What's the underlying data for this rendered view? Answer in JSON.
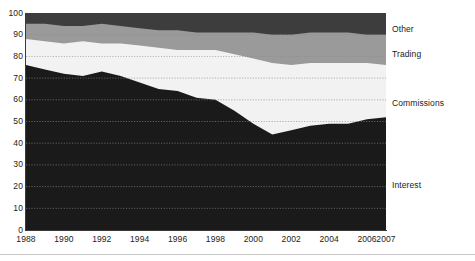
{
  "chart_data": {
    "type": "area",
    "stacked": true,
    "normalized": true,
    "title": "",
    "subtitle": "",
    "xlabel": "",
    "ylabel": "",
    "ylim": [
      0,
      100
    ],
    "xlim": [
      1988,
      2007
    ],
    "grid": true,
    "grid_style": "dotted-horizontal",
    "legend_position": "right-inline",
    "x": [
      1988,
      1989,
      1990,
      1991,
      1992,
      1993,
      1994,
      1995,
      1996,
      1997,
      1998,
      1999,
      2000,
      2001,
      2002,
      2003,
      2004,
      2005,
      2006,
      2007
    ],
    "categories": [
      "1988",
      "1989",
      "1990",
      "1991",
      "1992",
      "1993",
      "1994",
      "1995",
      "1996",
      "1997",
      "1998",
      "1999",
      "2000",
      "2001",
      "2002",
      "2003",
      "2004",
      "2005",
      "2006",
      "2007"
    ],
    "series": [
      {
        "name": "Interest",
        "color": "#1a1a1a",
        "values": [
          76,
          74,
          72,
          71,
          73,
          71,
          68,
          65,
          64,
          61,
          60,
          55,
          49,
          44,
          46,
          48,
          49,
          49,
          51,
          52
        ]
      },
      {
        "name": "Commissions",
        "color": "#f2f2f2",
        "values": [
          12,
          13,
          14,
          16,
          13,
          15,
          17,
          19,
          19,
          22,
          23,
          26,
          30,
          33,
          30,
          29,
          28,
          28,
          26,
          24
        ]
      },
      {
        "name": "Trading",
        "color": "#9a9a9a",
        "values": [
          7,
          8,
          8,
          7,
          9,
          8,
          8,
          8,
          9,
          8,
          8,
          10,
          12,
          13,
          14,
          14,
          14,
          14,
          13,
          14
        ]
      },
      {
        "name": "Other",
        "color": "#3d3d3d",
        "values": [
          5,
          5,
          6,
          6,
          5,
          6,
          7,
          8,
          8,
          9,
          9,
          9,
          9,
          10,
          10,
          9,
          9,
          9,
          10,
          10
        ]
      }
    ],
    "cumulative_boundaries": {
      "interest_top": [
        76,
        74,
        72,
        71,
        73,
        71,
        68,
        65,
        64,
        61,
        60,
        55,
        49,
        44,
        46,
        48,
        49,
        49,
        51,
        52
      ],
      "commissions_top": [
        88,
        87,
        86,
        87,
        86,
        86,
        85,
        84,
        83,
        83,
        83,
        81,
        79,
        77,
        76,
        77,
        77,
        77,
        77,
        76
      ],
      "trading_top": [
        95,
        95,
        94,
        94,
        95,
        94,
        93,
        92,
        92,
        91,
        91,
        91,
        91,
        90,
        90,
        91,
        91,
        91,
        90,
        90
      ],
      "other_top": [
        100,
        100,
        100,
        100,
        100,
        100,
        100,
        100,
        100,
        100,
        100,
        100,
        100,
        100,
        100,
        100,
        100,
        100,
        100,
        100
      ]
    },
    "y_ticks": [
      {
        "value": 100,
        "label": "100"
      },
      {
        "value": 90,
        "label": "90"
      },
      {
        "value": 80,
        "label": "80"
      },
      {
        "value": 70,
        "label": "70"
      },
      {
        "value": 60,
        "label": "60"
      },
      {
        "value": 50,
        "label": "50"
      },
      {
        "value": 40,
        "label": "40"
      },
      {
        "value": 30,
        "label": "30"
      },
      {
        "value": 20,
        "label": "20"
      },
      {
        "value": 10,
        "label": "10"
      },
      {
        "value": 0,
        "label": "0"
      }
    ],
    "x_ticks": [
      {
        "value": 1988,
        "label": "1988"
      },
      {
        "value": 1990,
        "label": "1990"
      },
      {
        "value": 1992,
        "label": "1992"
      },
      {
        "value": 1994,
        "label": "1994"
      },
      {
        "value": 1996,
        "label": "1996"
      },
      {
        "value": 1998,
        "label": "1998"
      },
      {
        "value": 2000,
        "label": "2000"
      },
      {
        "value": 2002,
        "label": "2002"
      },
      {
        "value": 2004,
        "label": "2004"
      },
      {
        "value": 2006,
        "label": "2006"
      },
      {
        "value": 2007,
        "label": "2007"
      }
    ],
    "annotations": [
      {
        "name": "Other",
        "label": "Other",
        "y_position": 24
      },
      {
        "name": "Trading",
        "label": "Trading",
        "y_position": 49
      },
      {
        "name": "Commissions",
        "label": "Commissions",
        "y_position": 98
      },
      {
        "name": "Interest",
        "label": "Interest",
        "y_position": 180
      }
    ]
  },
  "colors": {
    "interest": "#1a1a1a",
    "commissions": "#f2f2f2",
    "trading": "#9a9a9a",
    "other": "#3d3d3d",
    "axis": "#3a3a3a",
    "text": "#222222",
    "gridline": "#8c8c8c",
    "background": "#ffffff",
    "bottom_rule": "#c9c9c9"
  }
}
